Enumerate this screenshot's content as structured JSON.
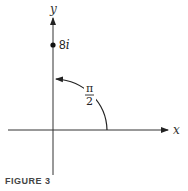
{
  "figure": {
    "caption": "FIGURE 3",
    "axes": {
      "x_label": "x",
      "y_label": "y"
    },
    "point": {
      "label_main": "8",
      "label_imag": "i",
      "description": "point 8i on positive imaginary axis"
    },
    "angle": {
      "numerator": "π",
      "denominator": "2"
    },
    "colors": {
      "ink": "#222222",
      "background": "#ffffff"
    }
  }
}
